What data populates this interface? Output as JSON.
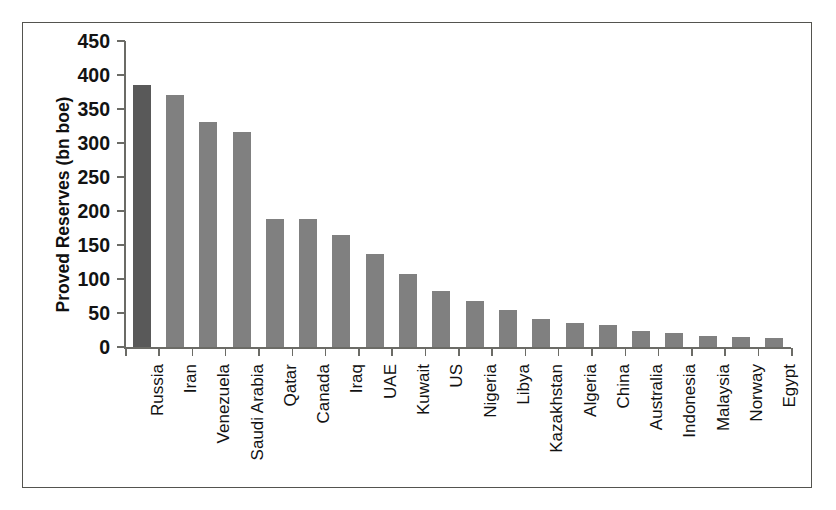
{
  "chart_data": {
    "type": "bar",
    "title": "",
    "xlabel": "",
    "ylabel": "Proved Reserves (bn boe)",
    "ylim": [
      0,
      450
    ],
    "ytick_labels": [
      "450",
      "400",
      "350",
      "300",
      "250",
      "200",
      "150",
      "100",
      "50",
      "0"
    ],
    "yticks": [
      450,
      400,
      350,
      300,
      250,
      200,
      150,
      100,
      50,
      0
    ],
    "grid": false,
    "legend": null,
    "highlight_category": "Russia",
    "colors": {
      "bar": "#808080",
      "bar_highlight": "#595959",
      "axis": "#6b6b66",
      "text": "#121212",
      "frame": "#54544f",
      "background": "#ffffff"
    },
    "categories": [
      "Russia",
      "Iran",
      "Venezuela",
      "Saudi Arabia",
      "Qatar",
      "Canada",
      "Iraq",
      "UAE",
      "Kuwait",
      "US",
      "Nigeria",
      "Libya",
      "Kazakhstan",
      "Algeria",
      "China",
      "Australia",
      "Indonesia",
      "Malaysia",
      "Norway",
      "Egypt"
    ],
    "values": [
      385,
      370,
      331,
      316,
      188,
      188,
      165,
      137,
      108,
      82,
      67,
      55,
      41,
      36,
      32,
      24,
      20,
      16,
      15,
      13
    ],
    "series": [
      {
        "name": "Proved Reserves",
        "unit": "bn boe",
        "values": [
          385,
          370,
          331,
          316,
          188,
          188,
          165,
          137,
          108,
          82,
          67,
          55,
          41,
          36,
          32,
          24,
          20,
          16,
          15,
          13
        ]
      }
    ]
  }
}
